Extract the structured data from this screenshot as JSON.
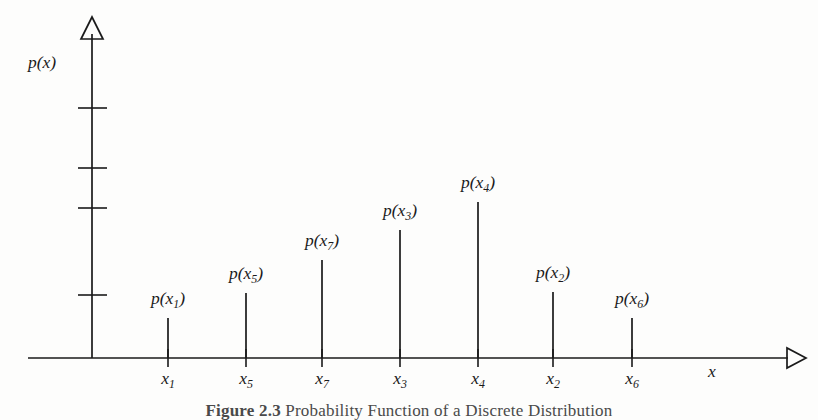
{
  "figure": {
    "caption_prefix": "Figure 2.3",
    "caption_text": "Probability Function of a Discrete Distribution",
    "ink_color": "#1a1a1a",
    "background_color": "#fdfdfc"
  },
  "axes": {
    "y_axis_label": "p(x)",
    "x_axis_label": "x",
    "y_arrowhead": "hollow-triangle-up",
    "x_arrowhead": "hollow-triangle-right",
    "y_tick_count": 4
  },
  "chart_data": {
    "type": "stem",
    "title": "Probability Function of a Discrete Distribution",
    "xlabel": "x",
    "ylabel": "p(x)",
    "grid": false,
    "legend": "none",
    "xlim": [
      0,
      8
    ],
    "ylim": [
      0,
      1
    ],
    "categories": [
      "x1",
      "x5",
      "x7",
      "x3",
      "x4",
      "x2",
      "x6"
    ],
    "tick_labels": [
      "x",
      "x",
      "x",
      "x",
      "x",
      "x",
      "x"
    ],
    "tick_subscripts": [
      "1",
      "5",
      "7",
      "3",
      "4",
      "2",
      "6"
    ],
    "stem_labels": [
      "p(x1)",
      "p(x5)",
      "p(x7)",
      "p(x3)",
      "p(x4)",
      "p(x2)",
      "p(x6)"
    ],
    "values": [
      0.16,
      0.26,
      0.38,
      0.52,
      0.63,
      0.27,
      0.16
    ],
    "x_positions_px": [
      168,
      246,
      322,
      400,
      478,
      553,
      632
    ],
    "stem_top_px": [
      318,
      293,
      260,
      230,
      202,
      292,
      318
    ],
    "baseline_px": 358,
    "y_tick_positions_px": [
      108,
      168,
      208,
      295
    ],
    "y_axis_x_px": 92,
    "x_axis_start_px": 28,
    "x_axis_end_px": 806,
    "y_axis_top_px": 18,
    "x_label_x_px": 712
  },
  "stems": [
    {
      "name": "stem-x1",
      "label_p": "p(",
      "label_x": "x",
      "label_sub": "1",
      "label_close": ")",
      "tick_x": "x",
      "tick_sub": "1"
    },
    {
      "name": "stem-x5",
      "label_p": "p(",
      "label_x": "x",
      "label_sub": "5",
      "label_close": ")",
      "tick_x": "x",
      "tick_sub": "5"
    },
    {
      "name": "stem-x7",
      "label_p": "p(",
      "label_x": "x",
      "label_sub": "7",
      "label_close": ")",
      "tick_x": "x",
      "tick_sub": "7"
    },
    {
      "name": "stem-x3",
      "label_p": "p(",
      "label_x": "x",
      "label_sub": "3",
      "label_close": ")",
      "tick_x": "x",
      "tick_sub": "3"
    },
    {
      "name": "stem-x4",
      "label_p": "p(",
      "label_x": "x",
      "label_sub": "4",
      "label_close": ")",
      "tick_x": "x",
      "tick_sub": "4"
    },
    {
      "name": "stem-x2",
      "label_p": "p(",
      "label_x": "x",
      "label_sub": "2",
      "label_close": ")",
      "tick_x": "x",
      "tick_sub": "2"
    },
    {
      "name": "stem-x6",
      "label_p": "p(",
      "label_x": "x",
      "label_sub": "6",
      "label_close": ")",
      "tick_x": "x",
      "tick_sub": "6"
    }
  ]
}
